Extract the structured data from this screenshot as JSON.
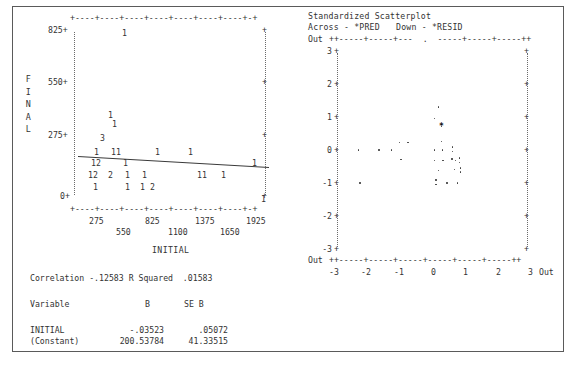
{
  "left_plot": {
    "y_axis_label": "FINAL",
    "x_axis_label": "INITIAL",
    "y_ticks": [
      "825",
      "550",
      "275",
      "0"
    ],
    "x_ticks_upper": [
      "275",
      "825",
      "1375",
      "1925"
    ],
    "x_ticks_lower": [
      "550",
      "1100",
      "1650"
    ],
    "top_axis_line": "+----+----+----+----+----+----+----+-+",
    "bottom_axis_line": "+----+----+----+----+----+----+----+-+",
    "plot_rows": [
      {
        "y": 23,
        "cells": [
          {
            "x": 110,
            "v": "1"
          }
        ]
      },
      {
        "y": 105,
        "cells": [
          {
            "x": 96,
            "v": "1"
          }
        ]
      },
      {
        "y": 114,
        "cells": [
          {
            "x": 100,
            "v": "1"
          }
        ]
      },
      {
        "y": 128,
        "cells": [
          {
            "x": 88,
            "v": "3"
          }
        ]
      },
      {
        "y": 142,
        "cells": [
          {
            "x": 82,
            "v": "1"
          },
          {
            "x": 99,
            "v": "11"
          },
          {
            "x": 143,
            "v": "1"
          },
          {
            "x": 176,
            "v": "1"
          }
        ]
      },
      {
        "y": 153,
        "cells": [
          {
            "x": 79,
            "v": "12"
          },
          {
            "x": 111,
            "v": "1"
          },
          {
            "x": 240,
            "v": "1"
          }
        ]
      },
      {
        "y": 165,
        "cells": [
          {
            "x": 76,
            "v": "12"
          },
          {
            "x": 96,
            "v": "2"
          },
          {
            "x": 113,
            "v": "1"
          },
          {
            "x": 130,
            "v": "1"
          },
          {
            "x": 185,
            "v": "11"
          },
          {
            "x": 209,
            "v": "1"
          }
        ]
      },
      {
        "y": 177,
        "cells": [
          {
            "x": 81,
            "v": "1"
          },
          {
            "x": 113,
            "v": "1"
          },
          {
            "x": 128,
            "v": "1"
          },
          {
            "x": 138,
            "v": "2"
          }
        ]
      },
      {
        "y": 189,
        "cells": [
          {
            "x": 249,
            "v": "1"
          }
        ]
      }
    ],
    "chart_data": {
      "type": "scatter",
      "title": "",
      "xlabel": "INITIAL",
      "ylabel": "FINAL",
      "xlim": [
        0,
        2200
      ],
      "ylim": [
        0,
        900
      ],
      "grid": false,
      "note": "Counts shown as digits; digit = number of overlapping cases at that cell.",
      "cells": [
        {
          "x": 1000,
          "y": 825,
          "count": 1
        },
        {
          "x": 700,
          "y": 380,
          "count": 1
        },
        {
          "x": 760,
          "y": 340,
          "count": 1
        },
        {
          "x": 600,
          "y": 290,
          "count": 3
        },
        {
          "x": 450,
          "y": 250,
          "count": 1
        },
        {
          "x": 620,
          "y": 250,
          "count": 1
        },
        {
          "x": 680,
          "y": 250,
          "count": 1
        },
        {
          "x": 1330,
          "y": 250,
          "count": 1
        },
        {
          "x": 1700,
          "y": 250,
          "count": 1
        },
        {
          "x": 380,
          "y": 205,
          "count": 1
        },
        {
          "x": 430,
          "y": 205,
          "count": 2
        },
        {
          "x": 790,
          "y": 205,
          "count": 1
        },
        {
          "x": 2050,
          "y": 205,
          "count": 1
        },
        {
          "x": 350,
          "y": 150,
          "count": 1
        },
        {
          "x": 400,
          "y": 150,
          "count": 2
        },
        {
          "x": 600,
          "y": 150,
          "count": 2
        },
        {
          "x": 800,
          "y": 150,
          "count": 1
        },
        {
          "x": 980,
          "y": 150,
          "count": 1
        },
        {
          "x": 1520,
          "y": 150,
          "count": 1
        },
        {
          "x": 1560,
          "y": 150,
          "count": 1
        },
        {
          "x": 1790,
          "y": 150,
          "count": 1
        },
        {
          "x": 430,
          "y": 100,
          "count": 1
        },
        {
          "x": 800,
          "y": 100,
          "count": 1
        },
        {
          "x": 960,
          "y": 100,
          "count": 1
        },
        {
          "x": 1030,
          "y": 100,
          "count": 2
        },
        {
          "x": 2130,
          "y": 20,
          "count": 1
        }
      ],
      "regression_line": {
        "intercept": 200.53784,
        "slope": -0.03523
      }
    }
  },
  "right_plot": {
    "title": "Standardized Scatterplot",
    "across_label": "Across - *PRED",
    "down_label": "Down - *RESID",
    "out_label_left": "Out",
    "out_label_bottom_left": "Out",
    "out_label_bottom_right": "Out",
    "top_axis_line": "++-----+-----+---  .  -----+-----+-----++",
    "bottom_axis_line": "++-----+-----+-----+-----+-----+-----++",
    "y_ticks": [
      "3",
      "2",
      "1",
      "0",
      "-1",
      "-2",
      "-3"
    ],
    "x_ticks": [
      "-3",
      "-2",
      "-1",
      "0",
      "1",
      "2",
      "3"
    ],
    "chart_data": {
      "type": "scatter",
      "title": "Standardized Scatterplot",
      "xlabel": "Across - *PRED",
      "ylabel": "Down - *RESID",
      "xlim": [
        -3,
        3
      ],
      "ylim": [
        -3,
        3
      ],
      "grid": false,
      "points": [
        {
          "x": -2.35,
          "y": 0.0
        },
        {
          "x": -1.7,
          "y": 0.0
        },
        {
          "x": -1.3,
          "y": 0.0
        },
        {
          "x": -1.05,
          "y": 0.22
        },
        {
          "x": -0.78,
          "y": 0.22
        },
        {
          "x": -2.3,
          "y": -1.0
        },
        {
          "x": -1.0,
          "y": -0.3
        },
        {
          "x": 0.18,
          "y": 1.3
        },
        {
          "x": 0.05,
          "y": 0.95
        },
        {
          "x": 0.28,
          "y": 0.7
        },
        {
          "x": 0.28,
          "y": 0.25
        },
        {
          "x": 0.05,
          "y": 0.0
        },
        {
          "x": 0.3,
          "y": 0.0
        },
        {
          "x": 0.62,
          "y": 0.08
        },
        {
          "x": 0.62,
          "y": -0.05
        },
        {
          "x": 0.05,
          "y": -0.32
        },
        {
          "x": 0.33,
          "y": -0.32
        },
        {
          "x": 0.6,
          "y": -0.28
        },
        {
          "x": 0.72,
          "y": -0.32
        },
        {
          "x": 0.85,
          "y": -0.25
        },
        {
          "x": 0.85,
          "y": -0.38
        },
        {
          "x": 0.18,
          "y": -0.62
        },
        {
          "x": 0.68,
          "y": -0.6
        },
        {
          "x": 0.88,
          "y": -0.55
        },
        {
          "x": 0.88,
          "y": -0.68
        },
        {
          "x": 0.1,
          "y": -0.92
        },
        {
          "x": 0.1,
          "y": -1.05
        },
        {
          "x": 0.45,
          "y": -1.0
        },
        {
          "x": 0.78,
          "y": -1.0
        }
      ],
      "overplot_markers": [
        {
          "x": 0.28,
          "y": 0.7,
          "symbol": "*"
        }
      ]
    }
  },
  "statistics": {
    "correlation_label": "Correlation",
    "correlation_value": "-.12583",
    "r_squared_label": "R Squared",
    "r_squared_value": ".01583",
    "table_headers": [
      "Variable",
      "B",
      "SE B"
    ],
    "rows": [
      {
        "variable": "INITIAL",
        "b": "-.03523",
        "se_b": ".05072"
      },
      {
        "variable": "(Constant)",
        "b": "200.53784",
        "se_b": "41.33515"
      }
    ]
  }
}
